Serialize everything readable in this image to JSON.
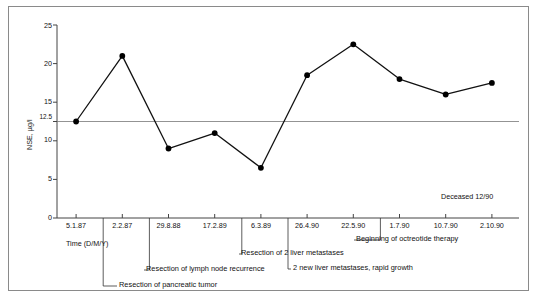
{
  "chart_data": {
    "type": "line",
    "title": "",
    "xlabel": "Time  (D/M/Y)",
    "ylabel": "NSE, µg/l",
    "ylim": [
      0,
      25
    ],
    "yticks": [
      0,
      5,
      10,
      12.5,
      15,
      20,
      25
    ],
    "ytick_labels": [
      "0",
      "5",
      "10",
      "12.5",
      "15",
      "20",
      "25"
    ],
    "grid": false,
    "reference_line": {
      "value": 12.5,
      "label": "12.5"
    },
    "categories": [
      "5.1.87",
      "2.2.87",
      "29.8.88",
      "17.2.89",
      "6.3.89",
      "26.4.90",
      "22.5.90",
      "1.7.90",
      "10.7.90",
      "2.10.90"
    ],
    "values": [
      12.5,
      21.0,
      9.0,
      11.0,
      6.5,
      18.5,
      22.5,
      18.0,
      16.0,
      17.5
    ],
    "series": [
      {
        "name": "NSE",
        "values": [
          12.5,
          21.0,
          9.0,
          11.0,
          6.5,
          18.5,
          22.5,
          18.0,
          16.0,
          17.5
        ]
      }
    ],
    "legend": [],
    "annotations": [
      {
        "text": "Resection of pancreatic tumor",
        "anchor_category": "2.2.87",
        "row": 4
      },
      {
        "text": "Resection of lymph node recurrence",
        "anchor_category": "29.8.88",
        "row": 3
      },
      {
        "text": "Resection of 2 liver metastases",
        "anchor_category": "6.3.89",
        "row": 2
      },
      {
        "text": "2 new liver metastases, rapid growth",
        "anchor_category": "26.4.90",
        "row": 1
      },
      {
        "text": "Beginning of octreotide therapy",
        "anchor_category": "1.7.90",
        "row": 0
      },
      {
        "text": "Deceased 12/90",
        "anchor_category": "",
        "row": -1
      }
    ]
  },
  "axes": {
    "y_label": "NSE, µg/l",
    "x_label": "Time  (D/M/Y)",
    "y_ticks": [
      "25",
      "20",
      "15",
      "12.5",
      "10",
      "5",
      "0"
    ],
    "x_ticks": [
      "5.1.87",
      "2.2.87",
      "29.8.88",
      "17.2.89",
      "6.3.89",
      "26.4.90",
      "22.5.90",
      "1.7.90",
      "10.7.90",
      "2.10.90"
    ]
  },
  "notes": {
    "deceased": "Deceased 12/90",
    "a1": "Resection of pancreatic tumor",
    "a2": "Resection of lymph node recurrence",
    "a3": "Resection of 2 liver metastases",
    "a4": "2 new liver metastases, rapid growth",
    "a5": "Beginning of octreotide therapy"
  },
  "style": {
    "line_color": "#111111",
    "marker_color": "#000000",
    "axis_color": "#444444",
    "reference_line_color": "#777777",
    "frame_color": "#8a8a8a"
  }
}
